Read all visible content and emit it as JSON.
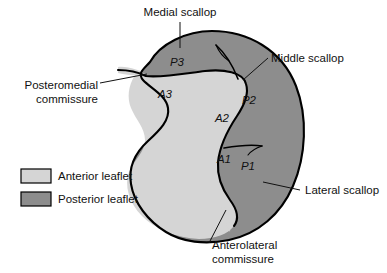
{
  "figure": {
    "colors": {
      "anterior_leaflet": "#d5d5d5",
      "posterior_leaflet": "#8d8d8d",
      "outline": "#000000",
      "background": "#ffffff",
      "text": "#111111"
    }
  },
  "segments": [
    {
      "id": "p3",
      "label": "P3",
      "leaflet": "posterior",
      "x": 177,
      "y": 66
    },
    {
      "id": "p2",
      "label": "P2",
      "leaflet": "posterior",
      "x": 249,
      "y": 104
    },
    {
      "id": "p1",
      "label": "P1",
      "leaflet": "posterior",
      "x": 248,
      "y": 170
    },
    {
      "id": "a3",
      "label": "A3",
      "leaflet": "anterior",
      "x": 165,
      "y": 98
    },
    {
      "id": "a2",
      "label": "A2",
      "leaflet": "anterior",
      "x": 222,
      "y": 122
    },
    {
      "id": "a1",
      "label": "A1",
      "leaflet": "anterior",
      "x": 224,
      "y": 163
    }
  ],
  "callouts": [
    {
      "id": "medial-scallop",
      "lines": [
        "Medial scallop"
      ],
      "align": "middle",
      "text_x": 180,
      "text_y": 16
    },
    {
      "id": "middle-scallop",
      "lines": [
        "Middle scallop"
      ],
      "align": "start",
      "text_x": 271,
      "text_y": 62
    },
    {
      "id": "lateral-scallop",
      "lines": [
        "Lateral scallop"
      ],
      "align": "start",
      "text_x": 305,
      "text_y": 194
    },
    {
      "id": "posteromedial-commissure",
      "lines": [
        "Posteromedial",
        "commissure"
      ],
      "align": "end",
      "text_x": 98,
      "text_y": 89
    },
    {
      "id": "anterolateral-commissure",
      "lines": [
        "Anterolateral",
        "commissure"
      ],
      "align": "start",
      "text_x": 212,
      "text_y": 249
    }
  ],
  "legend": {
    "items": [
      {
        "id": "anterior-leaflet",
        "label": "Anterior leaflet",
        "color": "#d5d5d5"
      },
      {
        "id": "posterior-leaflet",
        "label": "Posterior leaflet",
        "color": "#8d8d8d"
      }
    ]
  }
}
